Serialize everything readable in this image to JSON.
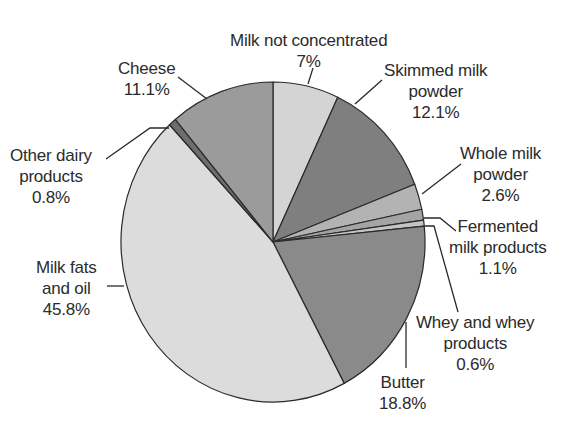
{
  "chart_data": {
    "type": "pie",
    "title": "",
    "start_angle_deg": 0,
    "direction": "clockwise",
    "slices": [
      {
        "label": "Milk not concentrated",
        "value": 7.0,
        "display": "7%",
        "color": "#d4d4d4"
      },
      {
        "label": "Skimmed milk powder",
        "value": 12.1,
        "display": "12.1%",
        "color": "#7f7f7f"
      },
      {
        "label": "Whole milk powder",
        "value": 2.6,
        "display": "2.6%",
        "color": "#b3b3b3"
      },
      {
        "label": "Fermented milk products",
        "value": 1.1,
        "display": "1.1%",
        "color": "#a4a4a4"
      },
      {
        "label": "Whey and whey products",
        "value": 0.6,
        "display": "0.6%",
        "color": "#c4c4c4"
      },
      {
        "label": "Butter",
        "value": 18.8,
        "display": "18.8%",
        "color": "#8a8a8a"
      },
      {
        "label": "Milk fats and oil",
        "value": 45.8,
        "display": "45.8%",
        "color": "#dcdcdc"
      },
      {
        "label": "Other dairy products",
        "value": 0.8,
        "display": "0.8%",
        "color": "#6e6e6e"
      },
      {
        "label": "Cheese",
        "value": 11.1,
        "display": "11.1%",
        "color": "#9b9b9b"
      }
    ],
    "legend": "none (callout labels)"
  },
  "labels": {
    "milk_not_concentrated": {
      "line1": "Milk not concentrated",
      "line2": "7%"
    },
    "skimmed": {
      "line1": "Skimmed milk",
      "line2": "powder",
      "line3": "12.1%"
    },
    "whole": {
      "line1": "Whole milk",
      "line2": "powder",
      "line3": "2.6%"
    },
    "fermented": {
      "line1": "Fermented",
      "line2": "milk products",
      "line3": "1.1%"
    },
    "whey": {
      "line1": "Whey and whey",
      "line2": "products",
      "line3": "0.6%"
    },
    "butter": {
      "line1": "Butter",
      "line2": "18.8%"
    },
    "milk_fats": {
      "line1": "Milk fats",
      "line2": "and oil",
      "line3": "45.8%"
    },
    "other": {
      "line1": "Other dairy",
      "line2": "products",
      "line3": "0.8%"
    },
    "cheese": {
      "line1": "Cheese",
      "line2": "11.1%"
    }
  }
}
